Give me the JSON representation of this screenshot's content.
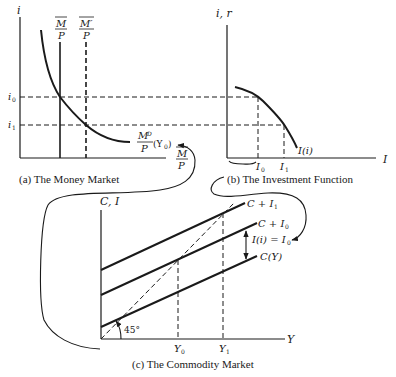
{
  "panels": {
    "money_market": {
      "caption": "(a) The Money Market",
      "y_axis_label": "i",
      "x_axis_label_num": "M",
      "x_axis_label_den": "P",
      "supply_label_num": "M",
      "supply_label_den": "P",
      "supply_shift_label_num": "M′",
      "supply_shift_label_den": "P",
      "demand_label_num": "M",
      "demand_label_sub": "D",
      "demand_label_den": "P",
      "demand_label_arg": "(Y",
      "demand_label_arg_sub": "0",
      "demand_label_close": ")",
      "rate_ticks": [
        {
          "base": "i",
          "sub": "0"
        },
        {
          "base": "i",
          "sub": "1"
        }
      ]
    },
    "investment_function": {
      "caption": "(b) The Investment Function",
      "y_axis_label": "i, r",
      "x_axis_label": "I",
      "curve_label": "I(i)",
      "investment_ticks": [
        {
          "base": "I",
          "sub": "0"
        },
        {
          "base": "I",
          "sub": "1"
        }
      ]
    },
    "commodity_market": {
      "caption": "(c) The Commodity Market",
      "y_axis_label": "C, I",
      "x_axis_label": "Y",
      "angle_label": "45°",
      "lines": [
        {
          "label": "C + I",
          "sub": "1"
        },
        {
          "label": "C + I",
          "sub": "0"
        },
        {
          "label": "C(Y)",
          "sub": ""
        }
      ],
      "gap_label": "I(i) = I",
      "gap_label_sub": "0",
      "income_ticks": [
        {
          "base": "Y",
          "sub": "0"
        },
        {
          "base": "Y",
          "sub": "1"
        }
      ]
    }
  },
  "colors": {
    "ink": "#1a1a1a",
    "background": "#ffffff"
  }
}
